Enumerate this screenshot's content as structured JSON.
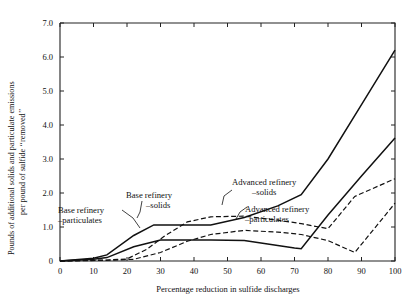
{
  "chart_data": {
    "type": "line",
    "title": "",
    "xlabel": "Percentage reduction in sulfide discharges",
    "ylabel": "Pounds of additional solids and particulate emissions per pound of sulfide \"removed\"",
    "ylabel_line1": "Pounds of additional solids and particulate emissions",
    "ylabel_line2": "per pound of sulfide ‘‘removed’’",
    "xlim": [
      0,
      100
    ],
    "ylim": [
      0,
      7.0
    ],
    "grid": false,
    "legend_position": "inline-annotations",
    "xticks": [
      0,
      10,
      20,
      30,
      40,
      50,
      60,
      70,
      80,
      90,
      100
    ],
    "xticklabels": [
      "0",
      "10",
      "20",
      "30",
      "40",
      "50",
      "60",
      "70",
      "80",
      "90",
      "100"
    ],
    "yticks": [
      0,
      1.0,
      2.0,
      3.0,
      4.0,
      5.0,
      6.0,
      7.0
    ],
    "yticklabels": [
      "0",
      "1.0",
      "2.0",
      "3.0",
      "4.0",
      "5.0",
      "6.0",
      "7.0"
    ],
    "series": [
      {
        "name": "Base refinery –solids",
        "style": "solid",
        "x": [
          0,
          10,
          14,
          22,
          28,
          45,
          55,
          65,
          72,
          80,
          90,
          100
        ],
        "values": [
          0.0,
          0.08,
          0.18,
          0.75,
          1.06,
          1.06,
          1.28,
          1.62,
          1.95,
          3.0,
          4.6,
          6.2
        ]
      },
      {
        "name": "Base refinery –particulates",
        "style": "solid",
        "x": [
          0,
          10,
          14,
          22,
          30,
          45,
          55,
          62,
          70,
          72,
          80,
          90,
          100
        ],
        "values": [
          0.0,
          0.05,
          0.1,
          0.42,
          0.62,
          0.62,
          0.6,
          0.5,
          0.38,
          0.36,
          1.35,
          2.5,
          3.62
        ]
      },
      {
        "name": "Advanced refinery –solids",
        "style": "dashed",
        "x": [
          0,
          14,
          20,
          26,
          31,
          38,
          45,
          55,
          65,
          72,
          80,
          88,
          100
        ],
        "values": [
          0.0,
          0.03,
          0.06,
          0.35,
          0.72,
          1.15,
          1.3,
          1.32,
          1.2,
          1.1,
          0.95,
          1.9,
          2.42
        ]
      },
      {
        "name": "Advanced refinery –particulates",
        "style": "dashed",
        "x": [
          0,
          14,
          22,
          30,
          38,
          45,
          55,
          65,
          72,
          80,
          88,
          100
        ],
        "values": [
          0.0,
          0.02,
          0.05,
          0.25,
          0.58,
          0.78,
          0.9,
          0.85,
          0.78,
          0.6,
          0.25,
          1.7
        ]
      }
    ],
    "annotations": [
      {
        "id": "base-solids",
        "line1": "Base refinery",
        "line2": "–solids",
        "text_x": 126,
        "text_y": 198
      },
      {
        "id": "base-particulates",
        "line1": "Base refinery",
        "line2": "–particulates",
        "text_x": 58,
        "text_y": 213
      },
      {
        "id": "advanced-solids",
        "line1": "Advanced refinery",
        "line2": "–solids",
        "text_x": 232,
        "text_y": 185
      },
      {
        "id": "advanced-particulates",
        "line1": "Advanced refinery",
        "line2": "–particulates",
        "text_x": 245,
        "text_y": 212
      }
    ]
  }
}
